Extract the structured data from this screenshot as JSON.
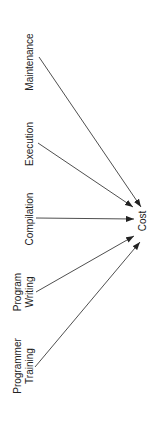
{
  "diagram": {
    "type": "influence-diagram",
    "orientation": "rotated-90-ccw",
    "target": {
      "label": "Cost"
    },
    "sources": [
      {
        "label_lines": [
          "Maintenance"
        ]
      },
      {
        "label_lines": [
          "Execution"
        ]
      },
      {
        "label_lines": [
          "Compilation"
        ]
      },
      {
        "label_lines": [
          "Program",
          "Writing"
        ]
      },
      {
        "label_lines": [
          "Programmer",
          "Training"
        ]
      }
    ],
    "edges": [
      {
        "from": "Maintenance",
        "to": "Cost"
      },
      {
        "from": "Execution",
        "to": "Cost"
      },
      {
        "from": "Compilation",
        "to": "Cost"
      },
      {
        "from": "Program Writing",
        "to": "Cost"
      },
      {
        "from": "Programmer Training",
        "to": "Cost"
      }
    ],
    "colors": {
      "line": "#222222",
      "text": "#222222",
      "background": "#ffffff"
    }
  }
}
